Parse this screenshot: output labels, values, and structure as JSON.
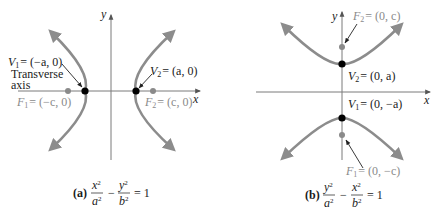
{
  "panel_a": {
    "axis_x_label": "x",
    "axis_y_label": "y",
    "v1": {
      "name": "V",
      "sub": "1",
      "value": "= (−a, 0)"
    },
    "v2": {
      "name": "V",
      "sub": "2",
      "value": "= (a, 0)"
    },
    "f1": {
      "name": "F",
      "sub": "1",
      "value": "= (−c, 0)"
    },
    "f2": {
      "name": "F",
      "sub": "2",
      "value": "= (c, 0)"
    },
    "transverse_line1": "Transverse",
    "transverse_line2": "axis",
    "caption_tag": "(a)",
    "caption_eq": {
      "n1": "x",
      "d1": "a",
      "n2": "y",
      "d2": "b",
      "sign": "−",
      "rhs": "= 1",
      "exp": "2"
    }
  },
  "panel_b": {
    "axis_x_label": "x",
    "axis_y_label": "y",
    "v1": {
      "name": "V",
      "sub": "1",
      "value": "= (0, −a)"
    },
    "v2": {
      "name": "V",
      "sub": "2",
      "value": "= (0, a)"
    },
    "f1": {
      "name": "F",
      "sub": "1",
      "value": "= (0, −c)"
    },
    "f2": {
      "name": "F",
      "sub": "2",
      "value": "= (0, c)"
    },
    "caption_tag": "(b)",
    "caption_eq": {
      "n1": "y",
      "d1": "a",
      "n2": "x",
      "d2": "b",
      "sign": "−",
      "rhs": "= 1",
      "exp": "2"
    }
  },
  "colors": {
    "curve": "#8c8c8c",
    "axis": "#7a7a7a",
    "vertex": "#000000",
    "focus": "#8a8a8a",
    "focus_label": "#9a9a9a"
  }
}
